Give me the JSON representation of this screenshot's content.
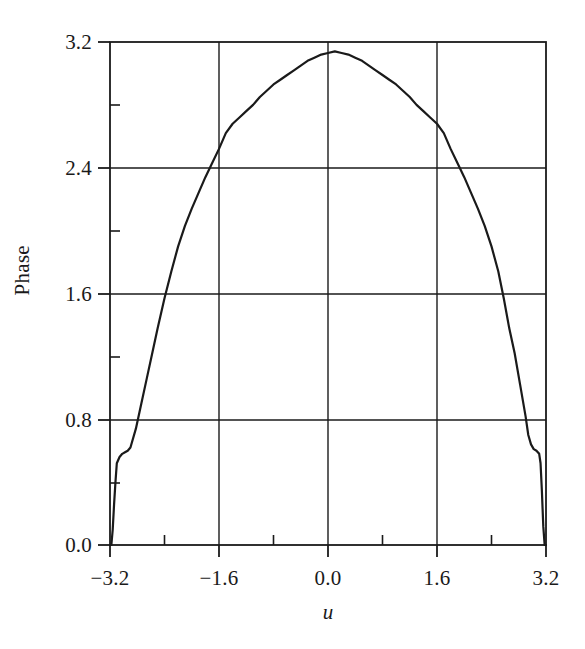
{
  "chart_data": {
    "type": "line",
    "title": "",
    "xlabel": "u",
    "ylabel": "Phase",
    "xlim": [
      -3.2,
      3.2
    ],
    "ylim": [
      0.0,
      3.2
    ],
    "grid": true,
    "legend": null,
    "xticks": [
      -3.2,
      -1.6,
      0.0,
      1.6,
      3.2
    ],
    "xtick_labels": [
      "−3.2",
      "−1.6",
      "0.0",
      "1.6",
      "3.2"
    ],
    "yticks": [
      0.0,
      0.8,
      1.6,
      2.4,
      3.2
    ],
    "ytick_labels": [
      "0.0",
      "0.8",
      "1.6",
      "2.4",
      "3.2"
    ],
    "x_minor_ticks": [
      -2.4,
      -0.8,
      0.8,
      2.4
    ],
    "y_minor_ticks": [
      0.4,
      1.2,
      2.0,
      2.8
    ],
    "line_color": "#1a1a1a",
    "line_width": 2.2,
    "series": [
      {
        "name": "Phase",
        "x": [
          -3.2,
          -3.18,
          -3.16,
          -3.14,
          -3.12,
          -3.1,
          -3.06,
          -3.02,
          -2.98,
          -2.94,
          -2.9,
          -2.82,
          -2.74,
          -2.66,
          -2.58,
          -2.5,
          -2.4,
          -2.3,
          -2.2,
          -2.1,
          -2.0,
          -1.9,
          -1.8,
          -1.7,
          -1.6,
          -1.5,
          -1.4,
          -1.3,
          -1.2,
          -1.1,
          -1.0,
          -0.9,
          -0.8,
          -0.7,
          -0.6,
          -0.5,
          -0.4,
          -0.3,
          -0.2,
          -0.1,
          0.0,
          0.1,
          0.2,
          0.3,
          0.4,
          0.5,
          0.6,
          0.7,
          0.8,
          0.9,
          1.0,
          1.1,
          1.2,
          1.3,
          1.4,
          1.5,
          1.6,
          1.7,
          1.8,
          1.9,
          2.0,
          2.1,
          2.2,
          2.3,
          2.4,
          2.5,
          2.58,
          2.66,
          2.74,
          2.82,
          2.9,
          2.94,
          2.98,
          3.02,
          3.06,
          3.1,
          3.12,
          3.14,
          3.16,
          3.18,
          3.2
        ],
        "y": [
          0.0,
          0.0,
          0.1,
          0.26,
          0.4,
          0.52,
          0.56,
          0.58,
          0.59,
          0.6,
          0.62,
          0.74,
          0.9,
          1.06,
          1.22,
          1.38,
          1.57,
          1.74,
          1.9,
          2.03,
          2.14,
          2.24,
          2.34,
          2.43,
          2.52,
          2.62,
          2.68,
          2.72,
          2.76,
          2.8,
          2.85,
          2.89,
          2.93,
          2.96,
          2.99,
          3.02,
          3.05,
          3.08,
          3.1,
          3.12,
          3.13,
          3.14,
          3.13,
          3.12,
          3.1,
          3.08,
          3.05,
          3.02,
          2.99,
          2.96,
          2.93,
          2.89,
          2.85,
          2.8,
          2.76,
          2.72,
          2.68,
          2.62,
          2.52,
          2.43,
          2.34,
          2.24,
          2.14,
          2.03,
          1.9,
          1.74,
          1.57,
          1.38,
          1.22,
          1.02,
          0.82,
          0.7,
          0.64,
          0.61,
          0.6,
          0.58,
          0.52,
          0.34,
          0.12,
          0.0,
          0.0
        ]
      }
    ],
    "annotations": []
  },
  "axes": {
    "ylabel": "Phase",
    "xlabel": "u",
    "ytick_labels": [
      "3.2",
      "2.4",
      "1.6",
      "0.8",
      "0.0"
    ],
    "xtick_labels": [
      "−3.2",
      "−1.6",
      "0.0",
      "1.6",
      "3.2"
    ]
  }
}
